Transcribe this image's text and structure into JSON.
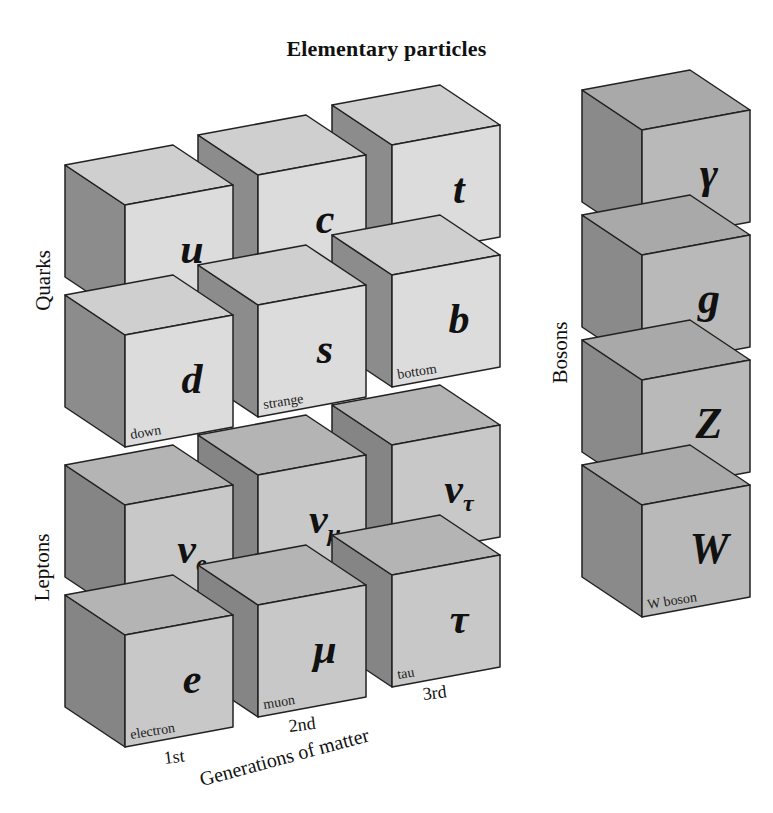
{
  "title": "Elementary particles",
  "colors": {
    "quark_front": "#dcdcdc",
    "quark_top": "#cfcfcf",
    "quark_side": "#8c8c8c",
    "lepton_front": "#c8c8c8",
    "lepton_top": "#b4b4b4",
    "lepton_side": "#858585",
    "boson_front": "#b9b9b9",
    "boson_top": "#a9a9a9",
    "boson_side": "#8a8a8a",
    "edge": "#222222",
    "background": "#ffffff"
  },
  "groups": {
    "quarks": "Quarks",
    "leptons": "Leptons",
    "bosons": "Bosons"
  },
  "axis": {
    "title": "Generations of matter",
    "generations": [
      "1st",
      "2nd",
      "3rd"
    ]
  },
  "particles": [
    {
      "symbol": "u",
      "sub": "",
      "name": "up",
      "group": "quarks",
      "generation": "1st",
      "row": 0
    },
    {
      "symbol": "d",
      "sub": "",
      "name": "down",
      "group": "quarks",
      "generation": "1st",
      "row": 1
    },
    {
      "symbol": "c",
      "sub": "",
      "name": "charm",
      "group": "quarks",
      "generation": "2nd",
      "row": 0
    },
    {
      "symbol": "s",
      "sub": "",
      "name": "strange",
      "group": "quarks",
      "generation": "2nd",
      "row": 1
    },
    {
      "symbol": "t",
      "sub": "",
      "name": "top",
      "group": "quarks",
      "generation": "3rd",
      "row": 0
    },
    {
      "symbol": "b",
      "sub": "",
      "name": "bottom",
      "group": "quarks",
      "generation": "3rd",
      "row": 1
    },
    {
      "symbol": "ν",
      "sub": "e",
      "name": "electron neutrino",
      "group": "leptons",
      "generation": "1st",
      "row": 2
    },
    {
      "symbol": "e",
      "sub": "",
      "name": "electron",
      "group": "leptons",
      "generation": "1st",
      "row": 3
    },
    {
      "symbol": "ν",
      "sub": "μ",
      "name": "muon neutrino",
      "group": "leptons",
      "generation": "2nd",
      "row": 2
    },
    {
      "symbol": "μ",
      "sub": "",
      "name": "muon",
      "group": "leptons",
      "generation": "2nd",
      "row": 3
    },
    {
      "symbol": "ν",
      "sub": "τ",
      "name": "tau neutrino",
      "group": "leptons",
      "generation": "3rd",
      "row": 2
    },
    {
      "symbol": "τ",
      "sub": "",
      "name": "tau",
      "group": "leptons",
      "generation": "3rd",
      "row": 3
    },
    {
      "symbol": "γ",
      "sub": "",
      "name": "photon",
      "group": "bosons",
      "generation": "",
      "row": 0
    },
    {
      "symbol": "g",
      "sub": "",
      "name": "gluon",
      "group": "bosons",
      "generation": "",
      "row": 1
    },
    {
      "symbol": "Z",
      "sub": "",
      "name": "Z boson",
      "group": "bosons",
      "generation": "",
      "row": 2
    },
    {
      "symbol": "W",
      "sub": "",
      "name": "W boson",
      "group": "bosons",
      "generation": "",
      "row": 3
    }
  ]
}
